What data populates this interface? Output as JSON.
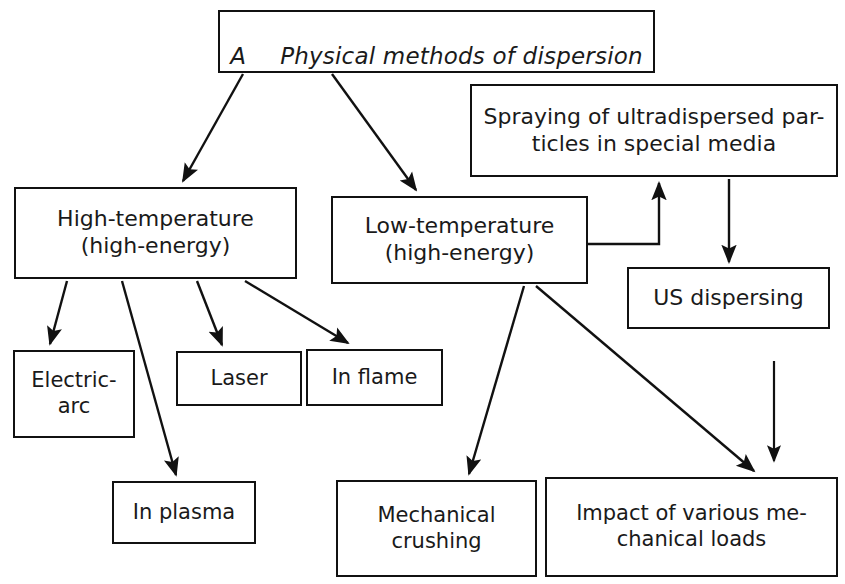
{
  "diagram": {
    "type": "flowchart",
    "orientation": "top-down",
    "line_color": "#111111",
    "background_color": "#ffffff",
    "text_color": "#1a1a1a",
    "root": {
      "letter": "A",
      "title": "Physical methods of dispersion",
      "style": "italic"
    },
    "nodes": {
      "spraying": "Spraying of ultradispersed par-\nticles in special media",
      "high_temperature": "High-temperature\n(high-energy)",
      "low_temperature": "Low-temperature\n(high-energy)",
      "us_dispersing": "US dispersing",
      "electric_arc": "Electric-\narc",
      "laser": "Laser",
      "in_flame": "In flame",
      "in_plasma": "In plasma",
      "mechanical_crushing": "Mechanical\ncrushing",
      "impact_loads": "Impact of various me-\nchanical loads"
    },
    "edges": [
      {
        "from": "root",
        "to": "high_temperature",
        "kind": "arrow-diagonal"
      },
      {
        "from": "root",
        "to": "low_temperature",
        "kind": "arrow-diagonal"
      },
      {
        "from": "high_temperature",
        "to": "electric_arc",
        "kind": "arrow-diagonal"
      },
      {
        "from": "high_temperature",
        "to": "in_plasma",
        "kind": "arrow-diagonal"
      },
      {
        "from": "high_temperature",
        "to": "laser",
        "kind": "arrow-diagonal"
      },
      {
        "from": "high_temperature",
        "to": "in_flame",
        "kind": "arrow-diagonal"
      },
      {
        "from": "low_temperature",
        "to": "spraying",
        "kind": "arrow-elbow-up"
      },
      {
        "from": "low_temperature",
        "to": "mechanical_crushing",
        "kind": "arrow-diagonal"
      },
      {
        "from": "low_temperature",
        "to": "impact_loads",
        "kind": "arrow-diagonal"
      },
      {
        "from": "spraying",
        "to": "us_dispersing",
        "kind": "arrow-vertical"
      },
      {
        "from": "us_dispersing",
        "to": "impact_loads",
        "kind": "arrow-vertical"
      }
    ]
  }
}
